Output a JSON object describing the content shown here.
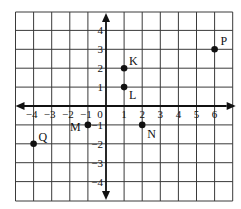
{
  "chart_data": {
    "type": "scatter",
    "title": "",
    "xlabel": "",
    "ylabel": "",
    "xlim": [
      -5,
      7
    ],
    "ylim": [
      -5,
      5
    ],
    "grid": true,
    "x_tick_labels": [
      "-4",
      "-3",
      "-2",
      "-1",
      "0",
      "1",
      "2",
      "3",
      "4",
      "5",
      "6"
    ],
    "y_tick_labels": [
      "4",
      "3",
      "2",
      "1",
      "-1",
      "-2",
      "-3",
      "-4"
    ],
    "origin_label": "0",
    "points": [
      {
        "label": "K",
        "x": 1,
        "y": 2
      },
      {
        "label": "L",
        "x": 1,
        "y": 1
      },
      {
        "label": "P",
        "x": 6,
        "y": 3
      },
      {
        "label": "M",
        "x": -1,
        "y": -1
      },
      {
        "label": "N",
        "x": 2,
        "y": -1
      },
      {
        "label": "Q",
        "x": -4,
        "y": -2
      }
    ]
  },
  "labels": {
    "origin": "0",
    "x_ticks": [
      {
        "v": -4,
        "t": "−4"
      },
      {
        "v": -3,
        "t": "−3"
      },
      {
        "v": -2,
        "t": "−2"
      },
      {
        "v": -1,
        "t": "−1"
      },
      {
        "v": 1,
        "t": "1"
      },
      {
        "v": 2,
        "t": "2"
      },
      {
        "v": 3,
        "t": "3"
      },
      {
        "v": 4,
        "t": "4"
      },
      {
        "v": 5,
        "t": "5"
      },
      {
        "v": 6,
        "t": "6"
      }
    ],
    "y_ticks": [
      {
        "v": 4,
        "t": "4"
      },
      {
        "v": 3,
        "t": "3"
      },
      {
        "v": 2,
        "t": "2"
      },
      {
        "v": 1,
        "t": "1"
      },
      {
        "v": -1,
        "t": "−1"
      },
      {
        "v": -2,
        "t": "−2"
      },
      {
        "v": -3,
        "t": "−3"
      },
      {
        "v": -4,
        "t": "−4"
      }
    ]
  },
  "colors": {
    "grid": "#3a3a3a",
    "axis": "#111111",
    "point": "#111111",
    "text": "#111111",
    "background": "#ffffff"
  }
}
